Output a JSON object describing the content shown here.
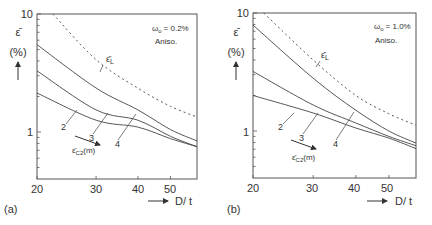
{
  "figure": {
    "panels": [
      {
        "label": "(a)",
        "annotation_line1": "ω",
        "annotation_sub": "o",
        "annotation_value": "= 0.2%",
        "annotation_line2": "Aniso.",
        "ylabel": "ε̄",
        "ylabel_unit": "(%)",
        "xlabel": "D/ t",
        "dashed_label": "ε̄",
        "dashed_label_sub": "L",
        "curve_labels": [
          "2",
          "3",
          "4"
        ],
        "arrow_label": "ε̄",
        "arrow_label_sub": "C2",
        "arrow_label_suffix": "(m)"
      },
      {
        "label": "(b)",
        "annotation_line1": "ω",
        "annotation_sub": "o",
        "annotation_value": "= 1.0%",
        "annotation_line2": "Aniso.",
        "ylabel": "ε̄",
        "ylabel_unit": "(%)",
        "xlabel": "D/ t",
        "dashed_label": "ε̄",
        "dashed_label_sub": "L",
        "curve_labels": [
          "2",
          "3",
          "4"
        ],
        "arrow_label": "ε̄",
        "arrow_label_sub": "C2",
        "arrow_label_suffix": "(m)"
      }
    ]
  },
  "chart_data": [
    {
      "type": "line",
      "title": "(a) ωo = 0.2%, Aniso.",
      "xlabel": "D/ t",
      "ylabel": "ε̄ (%)",
      "xscale": "log",
      "yscale": "log",
      "xlim": [
        20,
        60
      ],
      "ylim": [
        0.4,
        10
      ],
      "xticks": [
        20,
        30,
        40,
        50
      ],
      "yticks": [
        1,
        10
      ],
      "grid": false,
      "annotations": [
        "ωo = 0.2%",
        "Aniso.",
        "ε̄L",
        "ε̄C2(m)",
        "2",
        "3",
        "4"
      ],
      "x": [
        20,
        30,
        40,
        50,
        60
      ],
      "series": [
        {
          "name": "ε̄L",
          "style": "dashed",
          "x": [
            22.3,
            30,
            40,
            50,
            60
          ],
          "values": [
            10,
            4.1,
            2.35,
            1.65,
            1.34
          ]
        },
        {
          "name": "ε̄C2(4)",
          "style": "solid",
          "values": [
            5.5,
            2.36,
            1.54,
            1.05,
            0.84
          ]
        },
        {
          "name": "ε̄C2(3)",
          "style": "solid",
          "values": [
            3.3,
            1.54,
            1.26,
            0.92,
            0.75
          ]
        },
        {
          "name": "ε̄C2(2)",
          "style": "solid",
          "values": [
            2.14,
            1.26,
            1.1,
            0.88,
            0.75
          ]
        }
      ]
    },
    {
      "type": "line",
      "title": "(b) ωo = 1.0%, Aniso.",
      "xlabel": "D/ t",
      "ylabel": "ε̄ (%)",
      "xscale": "log",
      "yscale": "log",
      "xlim": [
        20,
        60
      ],
      "ylim": [
        0.4,
        10
      ],
      "xticks": [
        20,
        30,
        40,
        50
      ],
      "yticks": [
        1,
        10
      ],
      "grid": false,
      "annotations": [
        "ωo = 1.0%",
        "Aniso.",
        "ε̄L",
        "ε̄C2(m)",
        "2",
        "3",
        "4"
      ],
      "x": [
        20,
        30,
        40,
        50,
        60
      ],
      "series": [
        {
          "name": "ε̄L",
          "style": "dashed",
          "x": [
            21.5,
            30,
            40,
            50,
            60
          ],
          "values": [
            10,
            4.0,
            2.0,
            1.4,
            1.12
          ]
        },
        {
          "name": "ε̄C2(4)",
          "style": "solid",
          "values": [
            7.9,
            2.8,
            1.5,
            1.0,
            0.79
          ]
        },
        {
          "name": "ε̄C2(3)",
          "style": "solid",
          "values": [
            3.2,
            1.66,
            1.17,
            0.9,
            0.75
          ]
        },
        {
          "name": "ε̄C2(2)",
          "style": "solid",
          "values": [
            2.0,
            1.42,
            1.06,
            0.87,
            0.71
          ]
        }
      ]
    }
  ]
}
